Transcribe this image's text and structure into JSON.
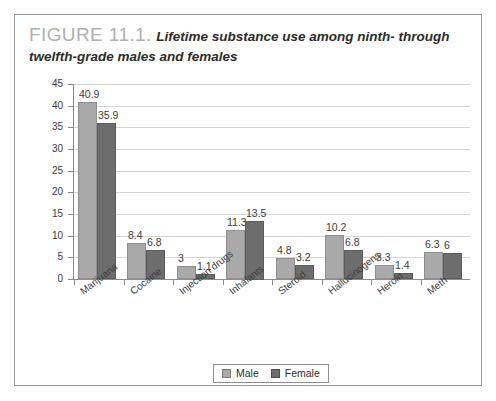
{
  "caption": {
    "figure_number": "FIGURE 11.1.",
    "text": "Lifetime substance use among ninth- through twelfth-grade males and females"
  },
  "legend": {
    "male_label": "Male",
    "female_label": "Female",
    "male_color": "#a9a9a9",
    "female_color": "#6d6d6d"
  },
  "chart_data": {
    "type": "bar",
    "title": "Lifetime substance use among ninth- through twelfth-grade males and females",
    "xlabel": "",
    "ylabel": "",
    "ylim": [
      0,
      45
    ],
    "yticks": [
      0,
      5,
      10,
      15,
      20,
      25,
      30,
      35,
      40,
      45
    ],
    "ytick_labels": [
      "0",
      "5",
      "10",
      "15",
      "20",
      "25",
      "30",
      "35",
      "40",
      "45"
    ],
    "grid": true,
    "legend_position": "bottom-center",
    "categories": [
      "Marijuana",
      "Cocaine",
      "Injection drugs",
      "Inhalants",
      "Steroid",
      "Hallucinogens",
      "Heroin",
      "Meth"
    ],
    "series": [
      {
        "name": "Male",
        "color": "#a9a9a9",
        "values": [
          40.9,
          8.4,
          3,
          11.3,
          4.8,
          10.2,
          3.3,
          6.3
        ],
        "labels": [
          "40.9",
          "8.4",
          "3",
          "11.3",
          "4.8",
          "10.2",
          "3.3",
          "6.3"
        ]
      },
      {
        "name": "Female",
        "color": "#6d6d6d",
        "values": [
          35.9,
          6.8,
          1.1,
          13.5,
          3.2,
          6.8,
          1.4,
          6
        ],
        "labels": [
          "35.9",
          "6.8",
          "1.1",
          "13.5",
          "3.2",
          "6.8",
          "1.4",
          "6"
        ]
      }
    ]
  }
}
